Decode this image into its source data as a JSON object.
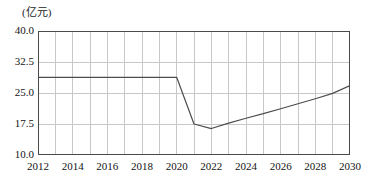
{
  "chart_data": {
    "type": "line",
    "title": "",
    "subtitle": "",
    "xlabel": "",
    "ylabel": "",
    "unit_label": "(亿元)",
    "grid": true,
    "legend": "none",
    "xlim": [
      2012,
      2030
    ],
    "ylim": [
      10.0,
      40.0
    ],
    "x_tick_labels": [
      "2012",
      "2014",
      "2016",
      "2018",
      "2020",
      "2022",
      "2024",
      "2026",
      "2028",
      "2030"
    ],
    "x_tick_values": [
      2012,
      2014,
      2016,
      2018,
      2020,
      2022,
      2024,
      2026,
      2028,
      2030
    ],
    "x_gridline_values": [
      2012,
      2013,
      2014,
      2015,
      2016,
      2017,
      2018,
      2019,
      2020,
      2021,
      2022,
      2023,
      2024,
      2025,
      2026,
      2027,
      2028,
      2029,
      2030
    ],
    "y_tick_labels": [
      "40.0",
      "32.5",
      "25.0",
      "17.5",
      "10.0"
    ],
    "y_tick_values": [
      40.0,
      32.5,
      25.0,
      17.5,
      10.0
    ],
    "x": [
      2012,
      2013,
      2014,
      2015,
      2016,
      2017,
      2018,
      2019,
      2020,
      2021,
      2022,
      2023,
      2024,
      2025,
      2026,
      2027,
      2028,
      2029,
      2030
    ],
    "values": [
      28.8,
      28.8,
      28.8,
      28.8,
      28.8,
      28.8,
      28.8,
      28.8,
      28.8,
      17.5,
      16.4,
      17.7,
      18.9,
      20.0,
      21.2,
      22.4,
      23.6,
      24.9,
      26.8
    ],
    "series": [
      {
        "name": "series-1",
        "color": "#4d4d4d",
        "values": [
          28.8,
          28.8,
          28.8,
          28.8,
          28.8,
          28.8,
          28.8,
          28.8,
          28.8,
          17.5,
          16.4,
          17.7,
          18.9,
          20.0,
          21.2,
          22.4,
          23.6,
          24.9,
          26.8
        ]
      }
    ]
  },
  "style": {
    "grid_color": "#c8c8c8",
    "frame_color": "#4a4a4a",
    "line_color": "#4d4d4d",
    "text_color": "#141414",
    "background": "#ffffff"
  }
}
